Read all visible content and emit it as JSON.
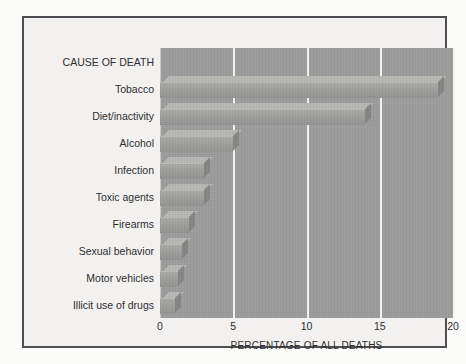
{
  "figure": {
    "frame_color": "#4e4f52",
    "page_background": "#f2f1ef",
    "plot_background": "#9b9b9b",
    "gridline_color": "#f3f3f0",
    "bar_front_color": "#9d9d9b",
    "bar_top_color": "#b6b6b3",
    "bar_side_color": "#848483",
    "header_label": "CAUSE OF DEATH"
  },
  "chart_data": {
    "type": "bar",
    "orientation": "horizontal",
    "title": "",
    "xlabel": "PERCENTAGE OF ALL DEATHS",
    "ylabel": "CAUSE OF DEATH",
    "xlim": [
      0,
      20
    ],
    "xticks": [
      "0",
      "5",
      "10",
      "15",
      "20"
    ],
    "xtick_values": [
      0,
      5,
      10,
      15,
      20
    ],
    "grid": "vertical",
    "legend": "none",
    "categories": [
      "Tobacco",
      "Diet/inactivity",
      "Alcohol",
      "Infection",
      "Toxic agents",
      "Firearms",
      "Sexual behavior",
      "Motor vehicles",
      "Illicit use of drugs"
    ],
    "values": [
      19,
      14,
      5,
      3,
      3,
      2,
      1.5,
      1.2,
      1
    ]
  }
}
